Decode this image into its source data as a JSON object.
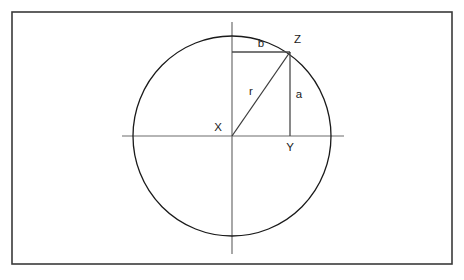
{
  "figure": {
    "background_color": "#ffffff",
    "frame": {
      "stroke_color": "#3a3a3a",
      "x": 12,
      "y": 12,
      "width": 440,
      "height": 252
    }
  },
  "chart_data": {
    "type": "diagram",
    "title": "",
    "xlabel": "",
    "ylabel": "",
    "geometry": {
      "circle": {
        "center_label": "X",
        "center_x": 232,
        "center_y": 136,
        "radius_x": 99,
        "radius_y": 100,
        "stroke_color": "#1a1a1a"
      },
      "axes": {
        "horizontal": {
          "x1": 122,
          "y1": 136,
          "x2": 344,
          "y2": 136
        },
        "vertical": {
          "x1": 232,
          "y1": 22,
          "x2": 232,
          "y2": 254
        },
        "stroke_color": "#6d6d6d"
      },
      "points": [
        {
          "label": "X",
          "role": "circle-center",
          "x": 232,
          "y": 136,
          "label_x": 222,
          "label_y": 128
        },
        {
          "label": "Y",
          "role": "foot-of-perpendicular",
          "x": 290,
          "y": 136,
          "label_x": 290,
          "label_y": 148
        },
        {
          "label": "Z",
          "role": "point-on-circumference",
          "x": 290,
          "y": 52,
          "label_x": 294,
          "label_y": 40
        }
      ],
      "segments": [
        {
          "label": "r",
          "description": "radius from center X to point Z on circumference (hypotenuse)",
          "x1": 232,
          "y1": 136,
          "x2": 290,
          "y2": 52,
          "label_x": 251,
          "label_y": 92
        },
        {
          "label": "a",
          "description": "vertical leg from Z down to Y on the horizontal axis",
          "x1": 290,
          "y1": 52,
          "x2": 290,
          "y2": 136,
          "label_x": 299,
          "label_y": 95
        },
        {
          "label": "b",
          "description": "horizontal leg from the vertical axis to Z",
          "x1": 232,
          "y1": 52,
          "x2": 290,
          "y2": 52,
          "label_x": 261,
          "label_y": 44
        }
      ]
    },
    "labels": {
      "center": "X",
      "foot": "Y",
      "circumference_point": "Z",
      "radius": "r",
      "vertical_leg": "a",
      "horizontal_leg": "b"
    }
  }
}
